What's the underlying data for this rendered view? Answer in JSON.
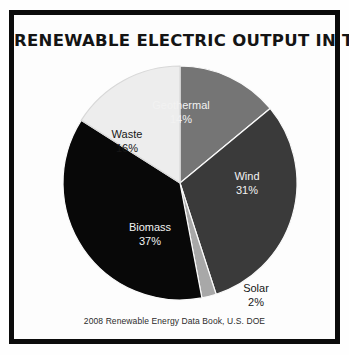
{
  "poster": {
    "title": "RENEWABLE ELECTRIC OUTPUT IN THE U.S.",
    "caption": "2008 Renewable Energy Data Book, U.S. DOE",
    "frame_color": "#0b0b0b",
    "background_color": "#ffffff"
  },
  "chart_data": {
    "type": "pie",
    "title": "RENEWABLE ELECTRIC OUTPUT IN THE U.S.",
    "subtitle": "",
    "xlabel": "",
    "ylabel": "",
    "annotations": [
      "2008 Renewable Energy Data Book, U.S. DOE"
    ],
    "legend": "none",
    "grid": false,
    "start_angle_deg": 0,
    "direction": "clockwise",
    "units": "percent",
    "total": 100,
    "categories": [
      "Geothermal",
      "Wind",
      "Solar",
      "Biomass",
      "Waste"
    ],
    "values": [
      14,
      31,
      2,
      37,
      16
    ],
    "value_labels": [
      "14%",
      "31%",
      "2%",
      "37%",
      "16%"
    ],
    "colors": [
      "#757575",
      "#3a3a3a",
      "#a8a8a8",
      "#080808",
      "#ededed"
    ],
    "slices": [
      {
        "name": "Geothermal",
        "value": 14,
        "label": "Geothermal",
        "value_label": "14%",
        "color": "#757575",
        "label_color": "#f2f2f2",
        "label_placement": "inside"
      },
      {
        "name": "Wind",
        "value": 31,
        "label": "Wind",
        "value_label": "31%",
        "color": "#3a3a3a",
        "label_color": "#f2f2f2",
        "label_placement": "inside"
      },
      {
        "name": "Solar",
        "value": 2,
        "label": "Solar",
        "value_label": "2%",
        "color": "#a8a8a8",
        "label_color": "#171717",
        "label_placement": "outside"
      },
      {
        "name": "Biomass",
        "value": 37,
        "label": "Biomass",
        "value_label": "37%",
        "color": "#080808",
        "label_color": "#f2f2f2",
        "label_placement": "inside"
      },
      {
        "name": "Waste",
        "value": 16,
        "label": "Waste",
        "value_label": "16%",
        "color": "#ededed",
        "label_color": "#171717",
        "label_placement": "inside"
      }
    ]
  }
}
